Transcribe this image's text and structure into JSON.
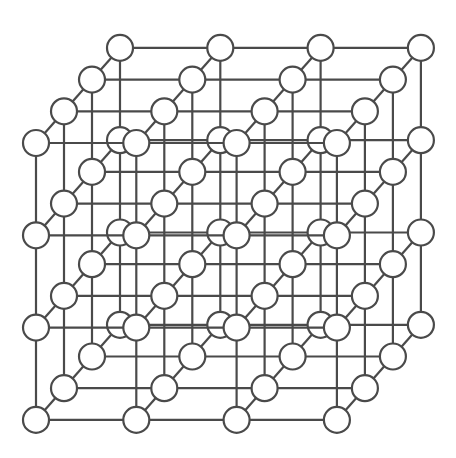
{
  "figure": {
    "name": "cubic-crystal-lattice",
    "title": "Cubic crystal lattice",
    "projection": "oblique",
    "background_color": "#ffffff",
    "line_color": "#4a4a4a",
    "atom_fill_color": "#ffffff",
    "atom_stroke_color": "#4a4a4a",
    "line_width": 2.2,
    "atom_radius": 13
  },
  "chart_data": {
    "type": "scatter",
    "title": "Cubic crystal lattice",
    "subtitle": "",
    "xlabel": "",
    "ylabel": "",
    "grid": true,
    "legend": "none",
    "lattice": {
      "dimensions": [
        4,
        4,
        4
      ],
      "atom_count": 64,
      "bond_count": 144,
      "origin_px": [
        36,
        143
      ],
      "step_x_px": [
        100.3,
        0
      ],
      "step_y_px": [
        0,
        92.3
      ],
      "step_z_px": [
        28.0,
        -31.7
      ],
      "i_range": [
        0,
        1,
        2,
        3
      ],
      "j_range": [
        0,
        1,
        2,
        3
      ],
      "k_range": [
        0,
        1,
        2,
        3
      ]
    }
  }
}
